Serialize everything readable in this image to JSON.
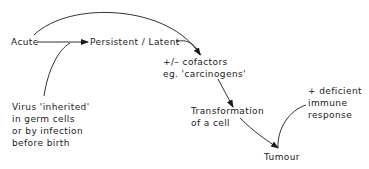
{
  "diagram": {
    "nodes": {
      "acute": "Acute",
      "persistent": "Persistent / Latent",
      "cofactors_line1": "+/–  cofactors",
      "cofactors_line2": "eg. 'carcinogens'",
      "virus_line1": "Virus 'inherited'",
      "virus_line2": "in germ cells",
      "virus_line3": "or by infection",
      "virus_line4": "before birth",
      "transformation_line1": "Transformation",
      "transformation_line2": "of a cell",
      "immune_line1": "+ deficient",
      "immune_line2": "immune",
      "immune_line3": "response",
      "tumour": "Tumour"
    },
    "edges": [
      {
        "from": "Acute",
        "to": "Persistent / Latent"
      },
      {
        "from": "Acute",
        "to": "cofactors"
      },
      {
        "from": "Persistent / Latent",
        "to": "cofactors"
      },
      {
        "from": "Virus 'inherited'",
        "to": "Persistent / Latent"
      },
      {
        "from": "cofactors",
        "to": "Transformation of a cell"
      },
      {
        "from": "Transformation of a cell",
        "to": "Tumour"
      },
      {
        "from": "+ deficient immune response",
        "to": "Tumour"
      }
    ],
    "line_color": "#1a1a1a"
  }
}
